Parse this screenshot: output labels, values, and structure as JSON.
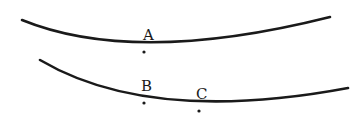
{
  "diagram": {
    "curves": [
      {
        "id": "upper",
        "path": "M 22 20 Q 135 66 330 17"
      },
      {
        "id": "lower",
        "path": "M 40 60 Q 150 125 348 88"
      }
    ],
    "points": [
      {
        "label": "A",
        "x": 144,
        "y": 52,
        "label_x": 143,
        "label_y": 40
      },
      {
        "label": "B",
        "x": 144,
        "y": 103,
        "label_x": 141,
        "label_y": 91
      },
      {
        "label": "C",
        "x": 199,
        "y": 111,
        "label_x": 196,
        "label_y": 99
      }
    ]
  },
  "labels": {
    "a": "A",
    "b": "B",
    "c": "C"
  },
  "colors": {
    "stroke": "#1a1a1a",
    "background": "#ffffff"
  }
}
